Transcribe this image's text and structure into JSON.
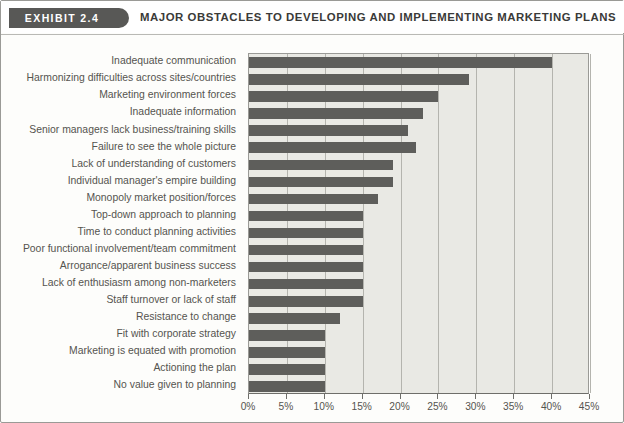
{
  "header": {
    "exhibit_tag": "EXHIBIT 2.4",
    "title": "MAJOR OBSTACLES TO DEVELOPING AND IMPLEMENTING MARKETING PLANS"
  },
  "colors": {
    "tag_background": "#585856",
    "bar_fill": "#5e5e5b",
    "plot_background": "#e9e9e4",
    "gridline": "#b4b4ae",
    "text": "#55544f"
  },
  "chart_data": {
    "type": "bar",
    "orientation": "horizontal",
    "title": "MAJOR OBSTACLES TO DEVELOPING AND IMPLEMENTING MARKETING PLANS",
    "xlabel": "",
    "ylabel": "",
    "xlim": [
      0,
      45
    ],
    "xtick_labels": [
      "0%",
      "5%",
      "10%",
      "15%",
      "20%",
      "25%",
      "30%",
      "35%",
      "40%",
      "45%"
    ],
    "xticks": [
      0,
      5,
      10,
      15,
      20,
      25,
      30,
      35,
      40,
      45
    ],
    "grid": true,
    "legend": "none",
    "value_unit": "%",
    "categories": [
      "Inadequate communication",
      "Harmonizing difficulties across sites/countries",
      "Marketing environment forces",
      "Inadequate information",
      "Senior managers lack business/training skills",
      "Failure to see the whole picture",
      "Lack of understanding of customers",
      "Individual manager's empire building",
      "Monopoly market position/forces",
      "Top-down approach to planning",
      "Time to conduct planning activities",
      "Poor functional involvement/team commitment",
      "Arrogance/apparent business success",
      "Lack of enthusiasm among non-marketers",
      "Staff turnover or lack of staff",
      "Resistance to change",
      "Fit with corporate strategy",
      "Marketing is equated with promotion",
      "Actioning the plan",
      "No value given to planning"
    ],
    "values": [
      40,
      29,
      25,
      23,
      21,
      22,
      19,
      19,
      17,
      15,
      15,
      15,
      15,
      15,
      15,
      12,
      10,
      10,
      10,
      10
    ]
  }
}
